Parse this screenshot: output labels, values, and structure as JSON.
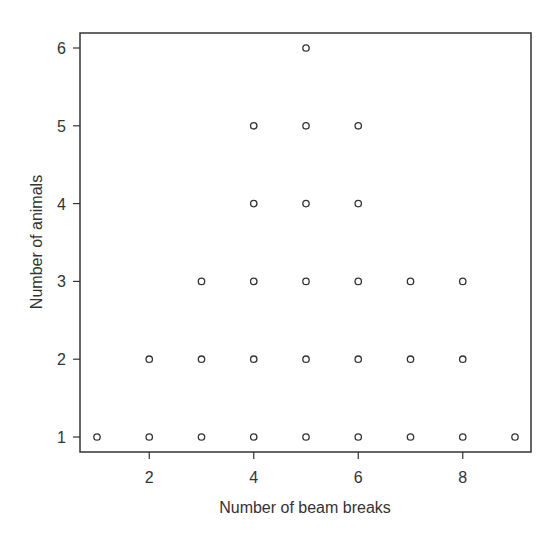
{
  "chart_data": {
    "type": "scatter",
    "title": "",
    "xlabel": "Number of beam breaks",
    "ylabel": "Number of animals",
    "xlim": [
      0.7,
      9.3
    ],
    "ylim": [
      0.8,
      6.2
    ],
    "xticks": [
      2,
      4,
      6,
      8
    ],
    "yticks": [
      1,
      2,
      3,
      4,
      5,
      6
    ],
    "grid": false,
    "legend": null,
    "marker": "open-circle",
    "points": [
      {
        "x": 1,
        "y": 1
      },
      {
        "x": 2,
        "y": 1
      },
      {
        "x": 3,
        "y": 1
      },
      {
        "x": 4,
        "y": 1
      },
      {
        "x": 5,
        "y": 1
      },
      {
        "x": 6,
        "y": 1
      },
      {
        "x": 7,
        "y": 1
      },
      {
        "x": 8,
        "y": 1
      },
      {
        "x": 9,
        "y": 1
      },
      {
        "x": 2,
        "y": 2
      },
      {
        "x": 3,
        "y": 2
      },
      {
        "x": 4,
        "y": 2
      },
      {
        "x": 5,
        "y": 2
      },
      {
        "x": 6,
        "y": 2
      },
      {
        "x": 7,
        "y": 2
      },
      {
        "x": 8,
        "y": 2
      },
      {
        "x": 3,
        "y": 3
      },
      {
        "x": 4,
        "y": 3
      },
      {
        "x": 5,
        "y": 3
      },
      {
        "x": 6,
        "y": 3
      },
      {
        "x": 7,
        "y": 3
      },
      {
        "x": 8,
        "y": 3
      },
      {
        "x": 4,
        "y": 4
      },
      {
        "x": 5,
        "y": 4
      },
      {
        "x": 6,
        "y": 4
      },
      {
        "x": 4,
        "y": 5
      },
      {
        "x": 5,
        "y": 5
      },
      {
        "x": 6,
        "y": 5
      },
      {
        "x": 5,
        "y": 6
      }
    ]
  },
  "colors": {
    "axis": "#333333",
    "marker": "#333333",
    "background": "#ffffff"
  }
}
